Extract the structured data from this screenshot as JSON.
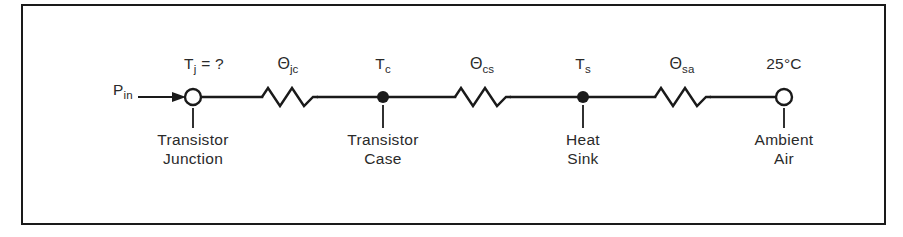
{
  "figure": {
    "type": "thermal-resistance-network-diagram",
    "border_color": "#1a1a1a",
    "line_color": "#1a1a1a",
    "text_color": "#2a2a2a",
    "background": "#ffffff"
  },
  "source": {
    "label_main": "P",
    "label_sub": "in",
    "arrow": "right-arrow"
  },
  "top_labels": {
    "junction_temp": {
      "main": "T",
      "sub": "j",
      "suffix": "= ?"
    },
    "theta_jc": {
      "symbol": "Θ",
      "sub": "jc"
    },
    "case_temp": {
      "main": "T",
      "sub": "c"
    },
    "theta_cs": {
      "symbol": "Θ",
      "sub": "cs"
    },
    "sink_temp": {
      "main": "T",
      "sub": "s"
    },
    "theta_sa": {
      "symbol": "Θ",
      "sub": "sa"
    },
    "ambient_temp": "25°C"
  },
  "nodes": [
    {
      "id": "junction",
      "style": "open-circle",
      "caption_line1": "Transistor",
      "caption_line2": "Junction"
    },
    {
      "id": "case",
      "style": "filled-dot",
      "caption_line1": "Transistor",
      "caption_line2": "Case"
    },
    {
      "id": "sink",
      "style": "filled-dot",
      "caption_line1": "Heat",
      "caption_line2": "Sink"
    },
    {
      "id": "ambient",
      "style": "open-circle",
      "caption_line1": "Ambient",
      "caption_line2": "Air"
    }
  ],
  "resistors": [
    {
      "id": "theta-jc",
      "label": "Θjc"
    },
    {
      "id": "theta-cs",
      "label": "Θcs"
    },
    {
      "id": "theta-sa",
      "label": "Θsa"
    }
  ]
}
